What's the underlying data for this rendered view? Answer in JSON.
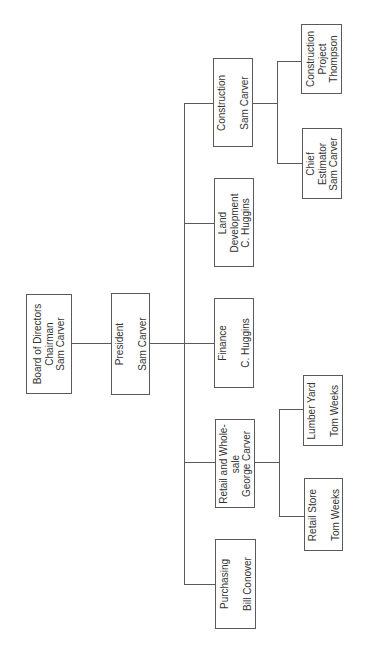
{
  "nodes": {
    "board": {
      "label": "Board of Directors\nChairman\nSam Carver"
    },
    "president": {
      "label": "President\n\nSam Carver"
    },
    "purchasing": {
      "label": "Purchasing\n\nBill Conover"
    },
    "retail_wholesale": {
      "label": "Retail and Whole-\nsale\nGeorge Carver"
    },
    "finance": {
      "label": "Finance\n\nC. Huggins"
    },
    "land_development": {
      "label": "Land\nDevelopment\nC. Huggins"
    },
    "construction": {
      "label": "Construction\n\nSam Carver"
    },
    "retail_store": {
      "label": "Retail Store\n\nTom Weeks"
    },
    "lumber_yard": {
      "label": "Lumber Yard\n\nTom Weeks"
    },
    "chief_estimator": {
      "label": "Chief\nEstimator\nSam Carver"
    },
    "construction_project": {
      "label": "Construction\nProject\nThompson"
    }
  },
  "hierarchy": {
    "Board of Directors": [
      "President"
    ],
    "President": [
      "Purchasing",
      "Retail and Wholesale",
      "Finance",
      "Land Development",
      "Construction"
    ],
    "Retail and Wholesale": [
      "Retail Store",
      "Lumber Yard"
    ],
    "Construction": [
      "Chief Estimator",
      "Construction Project"
    ]
  }
}
